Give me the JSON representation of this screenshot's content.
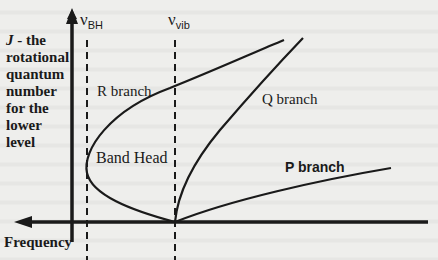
{
  "axes": {
    "y_label_symbol": "J",
    "y_label_text": " - the rotational quantum number for the lower level",
    "x_label": "Frequency"
  },
  "markers": {
    "band_head": {
      "symbol": "ν",
      "subscript": "BH"
    },
    "vibrational": {
      "symbol": "ν",
      "subscript": "vib"
    }
  },
  "branches": {
    "r": "R branch",
    "q": "Q branch",
    "p": "P branch",
    "band_head": "Band Head"
  },
  "colors": {
    "ink": "#1a1a1a",
    "paper": "#eeeeec"
  }
}
